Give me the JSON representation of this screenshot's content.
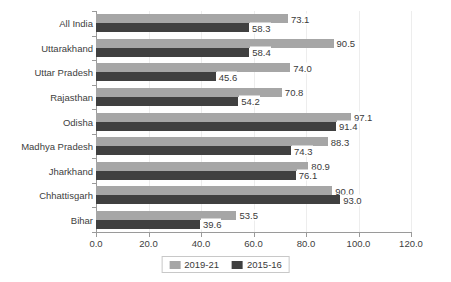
{
  "chart_data": {
    "type": "bar",
    "orientation": "horizontal",
    "title": "",
    "subtitle": "",
    "xlabel": "",
    "ylabel": "",
    "xlim": [
      0.0,
      120.0
    ],
    "xticks": [
      "0.0",
      "20.0",
      "40.0",
      "60.0",
      "80.0",
      "100.0",
      "120.0"
    ],
    "xtick_values": [
      0,
      20,
      40,
      60,
      80,
      100,
      120
    ],
    "grid": "vertical",
    "legend_position": "bottom-center",
    "categories": [
      "All India",
      "Uttarakhand",
      "Uttar Pradesh",
      "Rajasthan",
      "Odisha",
      "Madhya Pradesh",
      "Jharkhand",
      "Chhattisgarh",
      "Bihar"
    ],
    "series": [
      {
        "name": "2019-21",
        "color": "#a6a6a6",
        "values": [
          73.1,
          90.5,
          74.0,
          70.8,
          97.1,
          88.3,
          80.9,
          90.0,
          53.5
        ],
        "labels": [
          "73.1",
          "90.5",
          "74.0",
          "70.8",
          "97.1",
          "88.3",
          "80.9",
          "90.0",
          "53.5"
        ]
      },
      {
        "name": "2015-16",
        "color": "#404040",
        "values": [
          58.3,
          58.4,
          45.6,
          54.2,
          91.4,
          74.3,
          76.1,
          93.0,
          39.6
        ],
        "labels": [
          "58.3",
          "58.4",
          "45.6",
          "54.2",
          "91.4",
          "74.3",
          "76.1",
          "93.0",
          "39.6"
        ]
      }
    ]
  },
  "legend": {
    "entries": [
      {
        "label": "2019-21",
        "swatch": "series-a"
      },
      {
        "label": "2015-16",
        "swatch": "series-b"
      }
    ]
  },
  "colors": {
    "series_2019_21": "#a6a6a6",
    "series_2015_16": "#404040",
    "axis": "#9a9a9a",
    "gridline": "#ededed",
    "text": "#3a3a3a",
    "background": "#ffffff"
  }
}
